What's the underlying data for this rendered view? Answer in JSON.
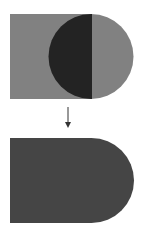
{
  "diagram": {
    "top": {
      "rect": {
        "x": 10,
        "y": 14,
        "w": 82,
        "h": 85,
        "color": "#818181"
      },
      "circle": {
        "cx": 91,
        "cy": 56.5,
        "r": 42.5,
        "color": "#818181"
      },
      "overlap_color": "#232323"
    },
    "arrow": {
      "x": 68,
      "y1": 107,
      "y2": 128,
      "color": "#333333",
      "icon": "arrow-down-icon"
    },
    "result": {
      "x": 10,
      "y": 138,
      "w": 124,
      "h": 85,
      "color": "#454545"
    }
  }
}
